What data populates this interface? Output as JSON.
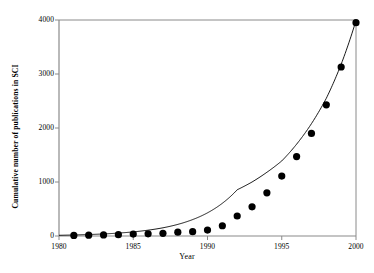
{
  "chart_data": {
    "type": "scatter",
    "title": "",
    "xlabel": "Year",
    "ylabel": "Cumulative number of publications in SCI",
    "xlim": [
      1980,
      2000
    ],
    "ylim": [
      0,
      4000
    ],
    "xticks": [
      1980,
      1985,
      1990,
      1995,
      2000
    ],
    "xticklabels": [
      "1980",
      "1985",
      "1990",
      "1995",
      "2000"
    ],
    "yticks": [
      0,
      1000,
      2000,
      3000,
      4000
    ],
    "yticklabels": [
      "0",
      "1000",
      "2000",
      "3000",
      "4000"
    ],
    "grid": false,
    "legend": null,
    "series": [
      {
        "name": "Cumulative publications",
        "type": "scatter",
        "marker": "filled-circle",
        "color": "#000000",
        "x": [
          1981,
          1982,
          1983,
          1984,
          1985,
          1986,
          1987,
          1988,
          1989,
          1990,
          1991,
          1992,
          1993,
          1994,
          1995,
          1996,
          1997,
          1998,
          1999,
          2000
        ],
        "y": [
          10,
          15,
          20,
          25,
          35,
          40,
          50,
          70,
          80,
          110,
          190,
          370,
          540,
          800,
          1110,
          1470,
          1900,
          2430,
          3130,
          3950
        ]
      },
      {
        "name": "Exponential fit",
        "type": "line",
        "color": "#000000",
        "x": [
          1980,
          1981,
          1982,
          1983,
          1984,
          1985,
          1986,
          1987,
          1988,
          1989,
          1990,
          1991,
          1992,
          1993,
          1994,
          1995,
          1996,
          1997,
          1998,
          1999,
          2000
        ],
        "y": [
          13,
          19,
          27,
          38,
          54,
          76,
          108,
          152,
          215,
          304,
          429,
          606,
          856,
          1000,
          1180,
          1390,
          1700,
          2080,
          2550,
          3180,
          3990
        ]
      }
    ]
  },
  "axes": {
    "x_title": "Year",
    "y_title": "Cumulative number of publications in SCI"
  },
  "style": {
    "marker_color": "#000000",
    "line_color": "#000000",
    "axis_color": "#808080",
    "background": "#ffffff"
  }
}
